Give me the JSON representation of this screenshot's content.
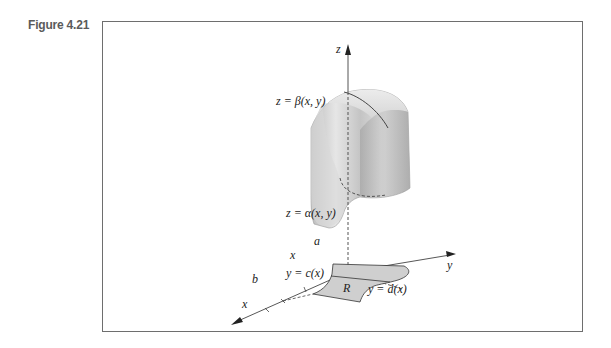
{
  "figure": {
    "label": "Figure 4.21"
  },
  "axes": {
    "z_label": "z",
    "y_label": "y",
    "x_label": "x"
  },
  "labels": {
    "top_surface": "z = β(x, y)",
    "bottom_surface": "z = α(x, y)",
    "a": "a",
    "b": "b",
    "x_tick": "x",
    "lower_curve": "y = c(x)",
    "upper_curve": "y = d(x)",
    "region": "R"
  },
  "colors": {
    "frame": "#6e6e6e",
    "region_fill": "#cfcfcf",
    "solid_light": "#e4e4e4",
    "solid_dark": "#a9a9a9",
    "axis": "#333333"
  }
}
